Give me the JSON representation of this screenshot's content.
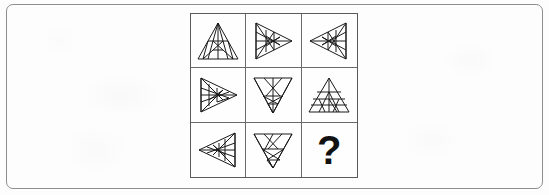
{
  "page": {
    "background_color": "#fdfdfd",
    "frame_color": "#8e8e90",
    "ink_color": "#1a1a1a"
  },
  "puzzle": {
    "kind": "matrix-reasoning-3x3",
    "rows": 3,
    "columns": 3,
    "grid_border_color": "#5a5a5c",
    "cell_border_color": "#6a6a6c",
    "cells": [
      {
        "index": 1,
        "position": "row1-col1",
        "shape": "triangle",
        "orientation": "up",
        "description": "Upward triangle subdivided by internal lines",
        "is_answer_slot": false,
        "label": ""
      },
      {
        "index": 2,
        "position": "row1-col2",
        "shape": "triangle",
        "orientation": "right",
        "description": "Right-pointing triangle subdivided by internal lines",
        "is_answer_slot": false,
        "label": ""
      },
      {
        "index": 3,
        "position": "row1-col3",
        "shape": "triangle",
        "orientation": "left",
        "description": "Left-pointing triangle subdivided by internal lines",
        "is_answer_slot": false,
        "label": ""
      },
      {
        "index": 4,
        "position": "row2-col1",
        "shape": "triangle",
        "orientation": "right",
        "description": "Right-pointing triangle subdivided by internal lines",
        "is_answer_slot": false,
        "label": ""
      },
      {
        "index": 5,
        "position": "row2-col2",
        "shape": "triangle",
        "orientation": "down",
        "description": "Downward triangle subdivided by internal lines",
        "is_answer_slot": false,
        "label": ""
      },
      {
        "index": 6,
        "position": "row2-col3",
        "shape": "triangle",
        "orientation": "up",
        "description": "Upward triangle with horizontal bands",
        "is_answer_slot": false,
        "label": ""
      },
      {
        "index": 7,
        "position": "row3-col1",
        "shape": "triangle",
        "orientation": "left",
        "description": "Left-pointing triangle subdivided by internal lines",
        "is_answer_slot": false,
        "label": ""
      },
      {
        "index": 8,
        "position": "row3-col2",
        "shape": "triangle",
        "orientation": "down",
        "description": "Downward triangle subdivided by internal lines",
        "is_answer_slot": false,
        "label": ""
      },
      {
        "index": 9,
        "position": "row3-col3",
        "shape": "question-mark",
        "orientation": "none",
        "description": "Missing answer cell marked with a question mark",
        "is_answer_slot": true,
        "label": "?"
      }
    ]
  }
}
